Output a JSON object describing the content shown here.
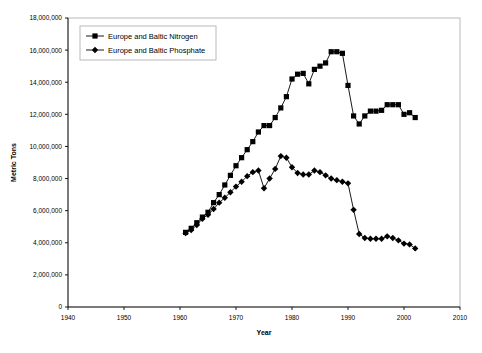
{
  "chart_data": {
    "type": "line",
    "title": "",
    "xlabel": "Year",
    "ylabel": "Metric Tons",
    "xlim": [
      1940,
      2010
    ],
    "ylim": [
      0,
      18000000
    ],
    "xticks": [
      1940,
      1950,
      1960,
      1970,
      1980,
      1990,
      2000,
      2010
    ],
    "yticks": [
      0,
      2000000,
      4000000,
      6000000,
      8000000,
      10000000,
      12000000,
      14000000,
      16000000,
      18000000
    ],
    "ytick_labels": [
      "0",
      "2,000,000",
      "4,000,000",
      "6,000,000",
      "8,000,000",
      "10,000,000",
      "12,000,000",
      "14,000,000",
      "16,000,000",
      "18,000,000"
    ],
    "xtick_labels": [
      "1940",
      "1950",
      "1960",
      "1970",
      "1980",
      "1990",
      "2000",
      "2010"
    ],
    "grid": false,
    "legend_position": "top-left",
    "series": [
      {
        "name": "Europe and Baltic Nitrogen",
        "marker": "square",
        "color": "#000000",
        "x": [
          1961,
          1962,
          1963,
          1964,
          1965,
          1966,
          1967,
          1968,
          1969,
          1970,
          1971,
          1972,
          1973,
          1974,
          1975,
          1976,
          1977,
          1978,
          1979,
          1980,
          1981,
          1982,
          1983,
          1984,
          1985,
          1986,
          1987,
          1988,
          1989,
          1990,
          1991,
          1992,
          1993,
          1994,
          1995,
          1996,
          1997,
          1998,
          1999,
          2000,
          2001,
          2002
        ],
        "values": [
          4650000,
          4900000,
          5250000,
          5600000,
          5900000,
          6500000,
          7000000,
          7600000,
          8200000,
          8800000,
          9300000,
          9800000,
          10300000,
          10900000,
          11300000,
          11300000,
          11800000,
          12400000,
          13100000,
          14200000,
          14500000,
          14550000,
          13900000,
          14800000,
          15000000,
          15200000,
          15900000,
          15900000,
          15800000,
          13800000,
          11900000,
          11400000,
          11900000,
          12200000,
          12200000,
          12250000,
          12600000,
          12600000,
          12600000,
          12000000,
          12100000,
          11800000
        ]
      },
      {
        "name": "Europe and Baltic Phosphate",
        "marker": "diamond",
        "color": "#000000",
        "x": [
          1961,
          1962,
          1963,
          1964,
          1965,
          1966,
          1967,
          1968,
          1969,
          1970,
          1971,
          1972,
          1973,
          1974,
          1975,
          1976,
          1977,
          1978,
          1979,
          1980,
          1981,
          1982,
          1983,
          1984,
          1985,
          1986,
          1987,
          1988,
          1989,
          1990,
          1991,
          1992,
          1993,
          1994,
          1995,
          1996,
          1997,
          1998,
          1999,
          2000,
          2001,
          2002
        ],
        "values": [
          4600000,
          4800000,
          5100000,
          5500000,
          5750000,
          6100000,
          6500000,
          6800000,
          7150000,
          7500000,
          7800000,
          8150000,
          8400000,
          8500000,
          7400000,
          8000000,
          8600000,
          9400000,
          9300000,
          8700000,
          8350000,
          8250000,
          8250000,
          8500000,
          8400000,
          8200000,
          8000000,
          7900000,
          7800000,
          7700000,
          6050000,
          4550000,
          4300000,
          4250000,
          4250000,
          4250000,
          4400000,
          4300000,
          4150000,
          3950000,
          3900000,
          3650000
        ]
      }
    ]
  },
  "legend": {
    "items": [
      {
        "label": "Europe and Baltic Nitrogen",
        "marker": "square"
      },
      {
        "label": "Europe and Baltic Phosphate",
        "marker": "diamond"
      }
    ]
  }
}
